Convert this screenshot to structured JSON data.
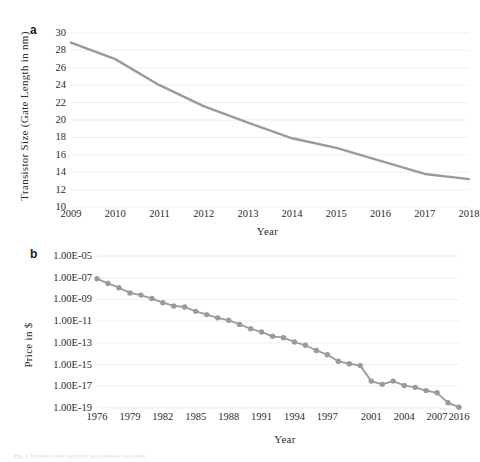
{
  "figure": {
    "background": "#ffffff",
    "line_color": "#9a9a9a",
    "marker_color": "#9a9a9a",
    "grid_color": "#f0f0f0",
    "text_color": "#2b2b2b",
    "caption": "Fig. 1  Transistor size and price per transistor over time"
  },
  "panel_a": {
    "letter": "a",
    "chart_data": {
      "type": "line",
      "title": "",
      "xlabel": "Year",
      "ylabel": "Transistor Size (Gate Length in nm)",
      "x": [
        2009,
        2010,
        2011,
        2012,
        2013,
        2014,
        2015,
        2016,
        2017,
        2018
      ],
      "x_ticklabels": [
        "2009",
        "2010",
        "2011",
        "2012",
        "2013",
        "2014",
        "2015",
        "2016",
        "2017",
        "2018"
      ],
      "values": [
        28.9,
        27.0,
        24.0,
        21.6,
        19.7,
        17.9,
        16.8,
        15.3,
        13.8,
        13.2
      ],
      "y_ticklabels": [
        "30",
        "28",
        "26",
        "24",
        "22",
        "20",
        "18",
        "16",
        "14",
        "12",
        "10"
      ],
      "yticks": [
        30,
        28,
        26,
        24,
        22,
        20,
        18,
        16,
        14,
        12,
        10
      ],
      "ylim": [
        10,
        30
      ],
      "xlim": [
        2009,
        2018
      ],
      "grid": true,
      "legend": "none",
      "markers": false
    }
  },
  "panel_b": {
    "letter": "b",
    "chart_data": {
      "type": "line",
      "title": "",
      "xlabel": "Year",
      "ylabel": "Price in $",
      "x": [
        1976,
        1977,
        1978,
        1979,
        1980,
        1981,
        1982,
        1983,
        1984,
        1985,
        1986,
        1987,
        1988,
        1989,
        1990,
        1991,
        1992,
        1993,
        1994,
        1995,
        1996,
        1997,
        1998,
        1999,
        2000,
        2001,
        2002,
        2003,
        2004,
        2005,
        2006,
        2007,
        2008,
        2016
      ],
      "x_ticklabels": [
        "1976",
        "1979",
        "1982",
        "1985",
        "1988",
        "1991",
        "1994",
        "1997",
        "2001",
        "2004",
        "2007",
        "2016"
      ],
      "values": [
        8e-08,
        3e-08,
        1.2e-08,
        4e-09,
        2.5e-09,
        1.2e-09,
        5e-10,
        2.5e-10,
        2e-10,
        8e-11,
        4e-11,
        2e-11,
        1.2e-11,
        5e-12,
        2e-12,
        1e-12,
        4e-13,
        3e-13,
        1.2e-13,
        6e-14,
        2e-14,
        8e-15,
        2e-15,
        1.2e-15,
        8e-16,
        3e-17,
        1.5e-17,
        3e-17,
        1.2e-17,
        8e-18,
        4e-18,
        2.5e-18,
        3e-19,
        1.2e-19
      ],
      "y_ticklabels": [
        "1.00E-05",
        "1.00E-07",
        "1.00E-09",
        "1.00E-11",
        "1.00E-13",
        "1.00E-15",
        "1.00E-17",
        "1.00E-19"
      ],
      "yticks": [
        -5,
        -7,
        -9,
        -11,
        -13,
        -15,
        -17,
        -19
      ],
      "yscale": "log",
      "ylim": [
        1e-19,
        1e-05
      ],
      "grid": true,
      "legend": "none",
      "markers": true
    }
  }
}
